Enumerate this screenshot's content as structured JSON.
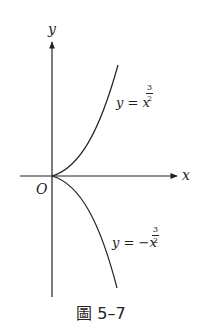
{
  "figure": {
    "caption": "圖 5–7",
    "axes": {
      "x_label": "x",
      "y_label": "y",
      "origin_label": "O"
    },
    "curves": [
      {
        "name": "upper",
        "lhs": "y = ",
        "sign": "",
        "base": "x",
        "exp_num": "3",
        "exp_den": "2"
      },
      {
        "name": "lower",
        "lhs": "y = ",
        "sign": "−",
        "base": "x",
        "exp_num": "3",
        "exp_den": "2"
      }
    ],
    "colors": {
      "ink": "#222222",
      "background": "#ffffff"
    }
  }
}
